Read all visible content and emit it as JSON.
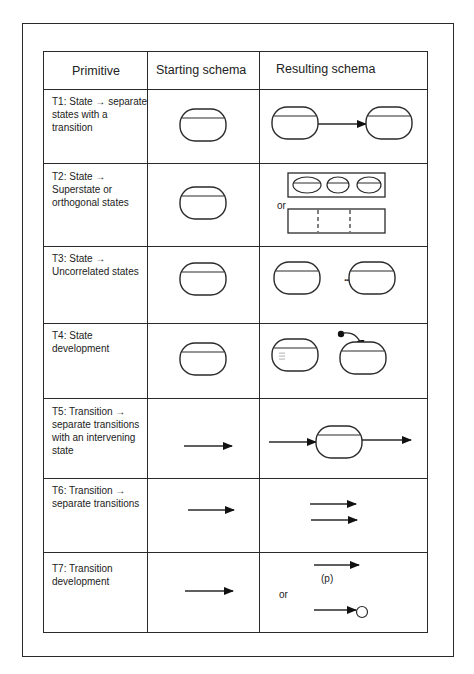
{
  "table": {
    "headers": {
      "primitive": "Primitive",
      "starting": "Starting schema",
      "resulting": "Resulting schema"
    },
    "rows": [
      {
        "id": "T1",
        "primitive": "T1: State → separate states with a transition",
        "starting": "state",
        "resulting": "state → state"
      },
      {
        "id": "T2",
        "primitive": "T2: State → Superstate or orthogonal states",
        "starting": "state",
        "resulting": "superstate with 3 substates or orthogonal regions",
        "or_label": "or"
      },
      {
        "id": "T3",
        "primitive": "T3: State → Uncorrelated states",
        "starting": "state",
        "resulting": "state ... state",
        "ellipsis": "..."
      },
      {
        "id": "T4",
        "primitive": "T4: State development",
        "starting": "state",
        "resulting": "state with refinement marks or state with initial transition",
        "or_label": "or"
      },
      {
        "id": "T5",
        "primitive": "T5: Transition → separate transitions with an intervening state",
        "starting": "transition",
        "resulting": "transition → state → transition"
      },
      {
        "id": "T6",
        "primitive": "T6: Transition → separate transitions",
        "starting": "transition",
        "resulting": "two parallel transitions"
      },
      {
        "id": "T7",
        "primitive": "T7: Transition development",
        "starting": "transition",
        "resulting": "transition with (p) or transition to final point",
        "or_label": "or",
        "p_label": "(p)"
      }
    ]
  },
  "colors": {
    "line": "#2a2a2a",
    "text": "#222222",
    "background": "#ffffff"
  }
}
